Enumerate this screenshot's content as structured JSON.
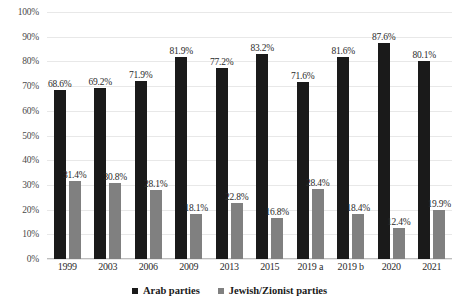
{
  "chart_data": {
    "type": "bar",
    "title": "",
    "subtitle": "",
    "xlabel": "",
    "ylabel": "",
    "ylim": [
      0,
      100
    ],
    "ytick_labels": [
      "100%",
      "90%",
      "80%",
      "70%",
      "60%",
      "50%",
      "40%",
      "30%",
      "20%",
      "10%",
      "0%"
    ],
    "ytick_values": [
      100,
      90,
      80,
      70,
      60,
      50,
      40,
      30,
      20,
      10,
      0
    ],
    "grid": true,
    "legend_position": "bottom-center",
    "value_labels": true,
    "value_label_suffix": "%",
    "categories": [
      "1999",
      "2003",
      "2006",
      "2009",
      "2013",
      "2015",
      "2019 a",
      "2019 b",
      "2020",
      "2021"
    ],
    "series": [
      {
        "name": "Arab parties",
        "color": "#1a1a1a",
        "values": [
          68.6,
          69.2,
          71.9,
          81.9,
          77.2,
          83.2,
          71.6,
          81.6,
          87.6,
          80.1
        ],
        "labels": [
          "68.6%",
          "69.2%",
          "71.9%",
          "81.9%",
          "77.2%",
          "83.2%",
          "71.6%",
          "81.6%",
          "87.6%",
          "80.1%"
        ]
      },
      {
        "name": "Jewish/Zionist parties",
        "color": "#808080",
        "values": [
          31.4,
          30.8,
          28.1,
          18.1,
          22.8,
          16.8,
          28.4,
          18.4,
          12.4,
          19.9
        ],
        "labels": [
          "31.4%",
          "30.8%",
          "28.1%",
          "18.1%",
          "22.8%",
          "16.8%",
          "28.4%",
          "18.4%",
          "12.4%",
          "19.9%"
        ]
      }
    ]
  },
  "legend": {
    "entries": [
      {
        "label": "Arab parties",
        "color": "#1a1a1a"
      },
      {
        "label": "Jewish/Zionist parties",
        "color": "#808080"
      }
    ]
  }
}
